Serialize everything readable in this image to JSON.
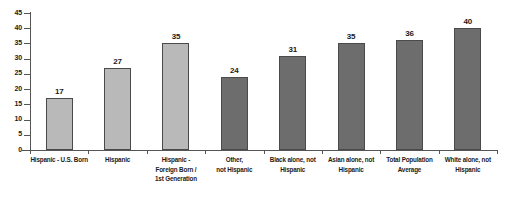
{
  "chart_data": {
    "type": "bar",
    "title": "",
    "subtitle": "",
    "xlabel": "",
    "ylabel": "",
    "ylim": [
      0,
      45
    ],
    "ytick_step": 5,
    "yticks": [
      0,
      5,
      10,
      15,
      20,
      25,
      30,
      35,
      40,
      45
    ],
    "grid": false,
    "legend": null,
    "categories": [
      "Hispanic - U.S. Born",
      "Hispanic",
      "Hispanic - Foreign Born / 1st Generation",
      "Other, not Hispanic",
      "Black alone, not Hispanic",
      "Asian alone, not Hispanic",
      "Total Population Average",
      "White alone, not Hispanic"
    ],
    "category_label_lines": [
      [
        "Hispanic - U.S. Born"
      ],
      [
        "Hispanic"
      ],
      [
        "Hispanic -",
        "Foreign Born /",
        "1st Generation"
      ],
      [
        "Other,",
        "not Hispanic"
      ],
      [
        "Black alone, not",
        "Hispanic"
      ],
      [
        "Asian alone, not",
        "Hispanic"
      ],
      [
        "Total Population",
        "Average"
      ],
      [
        "White alone, not",
        "Hispanic"
      ]
    ],
    "values": [
      17,
      27,
      35,
      24,
      31,
      35,
      36,
      40
    ],
    "value_labels": [
      "17",
      "27",
      "35",
      "24",
      "31",
      "35",
      "36",
      "40"
    ],
    "bar_colors": [
      "#b9b9b9",
      "#b9b9b9",
      "#b9b9b9",
      "#6d6d6d",
      "#6d6d6d",
      "#6d6d6d",
      "#6d6d6d",
      "#6d6d6d"
    ],
    "bar_color_groups": [
      "light",
      "light",
      "light",
      "dark",
      "dark",
      "dark",
      "dark",
      "dark"
    ],
    "bar_border_color": "#4a4a4a",
    "axis_color": "#555555",
    "background_color": "#ffffff",
    "text_color": "#1a1a1a"
  }
}
